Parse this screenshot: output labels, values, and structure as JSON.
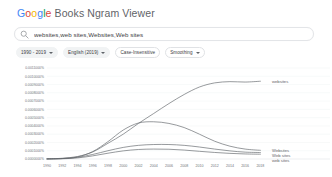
{
  "header": {
    "title": "Google Books Ngram Viewer",
    "title_brand": "Google",
    "title_rest": " Books Ngram Viewer",
    "brand_colors": [
      "#4285F4",
      "#DB4437",
      "#F4B400",
      "#4285F4",
      "#0F9D58",
      "#DB4437"
    ]
  },
  "search": {
    "icon": "search-icon",
    "value": "websites,web sites,Websites,Web sites",
    "placeholder": "Enter comma-separated phrases"
  },
  "filters": [
    {
      "label": "1990 - 2019",
      "has_caret": true,
      "style": "filled",
      "name": "date-range-chip"
    },
    {
      "label": "English (2019)",
      "has_caret": true,
      "style": "filled",
      "name": "corpus-chip"
    },
    {
      "label": "Case-Insensitive",
      "has_caret": false,
      "style": "outline",
      "name": "case-insensitive-chip"
    },
    {
      "label": "Smoothing",
      "has_caret": true,
      "style": "outline",
      "name": "smoothing-chip"
    }
  ],
  "chart_data": {
    "type": "line",
    "title": "",
    "xlabel": "",
    "ylabel": "",
    "grid": true,
    "legend_position": "right-inline",
    "x": [
      1990,
      1992,
      1994,
      1996,
      1998,
      2000,
      2002,
      2004,
      2006,
      2008,
      2010,
      2012,
      2014,
      2016,
      2018
    ],
    "xtick_labels": [
      "1990",
      "1992",
      "1994",
      "1996",
      "1998",
      "2000",
      "2002",
      "2004",
      "2006",
      "2008",
      "2010",
      "2012",
      "2014",
      "2016",
      "2018"
    ],
    "xlim": [
      1990,
      2019
    ],
    "ylim": [
      0.0,
      0.0011
    ],
    "ytick_labels": [
      "0.0011000%",
      "0.0010000%",
      "0.0009000%",
      "0.0008000%",
      "0.0007000%",
      "0.0006000%",
      "0.0005000%",
      "0.0004000%",
      "0.0003000%",
      "0.0002000%",
      "0.0001000%",
      "0.0000000%"
    ],
    "ytick_values": [
      0.0011,
      0.001,
      0.0009,
      0.0008,
      0.0007,
      0.0006,
      0.0005,
      0.0004,
      0.0003,
      0.0002,
      0.0001,
      0.0
    ],
    "series": [
      {
        "name": "websites",
        "color": "#5f6368",
        "label_position": "top-right",
        "values": [
          2e-06,
          9e-06,
          3e-05,
          8.5e-05,
          0.00019,
          0.0003,
          0.00043,
          0.00055,
          0.00067,
          0.00078,
          0.00087,
          0.00092,
          0.000935,
          0.00093,
          0.00094
        ]
      },
      {
        "name": "Websites",
        "color": "#5f6368",
        "label_position": "bottom-right",
        "values": [
          1e-06,
          6e-06,
          2.5e-05,
          9e-05,
          0.00021,
          0.00035,
          0.000435,
          0.00045,
          0.00043,
          0.00038,
          0.0003,
          0.000215,
          0.000155,
          0.00012,
          0.000105
        ]
      },
      {
        "name": "Web sites",
        "color": "#5f6368",
        "label_position": "bottom-right",
        "values": [
          1e-06,
          5e-06,
          2e-05,
          5.5e-05,
          0.0001,
          0.00014,
          0.000165,
          0.000175,
          0.000175,
          0.000165,
          0.000145,
          0.00012,
          9.8e-05,
          8.3e-05,
          7.8e-05
        ]
      },
      {
        "name": "web sites",
        "color": "#5f6368",
        "label_position": "bottom-right",
        "values": [
          5e-07,
          3e-06,
          1.3e-05,
          3.8e-05,
          7e-05,
          9.8e-05,
          0.000115,
          0.00012,
          0.000118,
          0.000108,
          9.3e-05,
          7.9e-05,
          6.8e-05,
          6.1e-05,
          5.8e-05
        ]
      }
    ]
  }
}
